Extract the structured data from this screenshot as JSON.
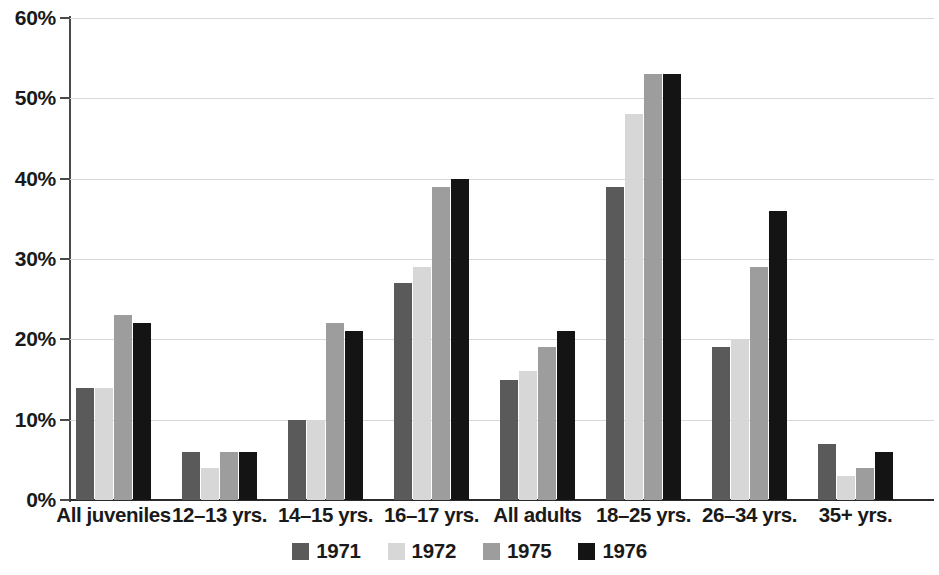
{
  "chart_data": {
    "type": "bar",
    "title": "",
    "subtitle": "",
    "xlabel": "",
    "ylabel": "",
    "ylim": [
      0,
      60
    ],
    "y_tick_values": [
      0,
      10,
      20,
      30,
      40,
      50,
      60
    ],
    "y_tick_labels": [
      "0%",
      "10%",
      "20%",
      "30%",
      "40%",
      "50%",
      "60%"
    ],
    "grid": true,
    "grid_axis": "y",
    "legend_position": "bottom",
    "categories": [
      "All juveniles",
      "12–13 yrs.",
      "14–15 yrs.",
      "16–17 yrs.",
      "All adults",
      "18–25 yrs.",
      "26–34 yrs.",
      "35+ yrs."
    ],
    "series": [
      {
        "name": "1971",
        "color": "#5a5a5a",
        "values": [
          14,
          6,
          10,
          27,
          15,
          39,
          19,
          7
        ]
      },
      {
        "name": "1972",
        "color": "#d7d7d7",
        "values": [
          14,
          4,
          10,
          29,
          16,
          48,
          20,
          3
        ]
      },
      {
        "name": "1975",
        "color": "#9d9d9d",
        "values": [
          23,
          6,
          22,
          39,
          19,
          53,
          29,
          4
        ]
      },
      {
        "name": "1976",
        "color": "#141414",
        "values": [
          22,
          6,
          21,
          40,
          21,
          53,
          36,
          6
        ]
      }
    ]
  },
  "legend": {
    "items": [
      {
        "label": "1971",
        "color": "#5a5a5a"
      },
      {
        "label": "1972",
        "color": "#d7d7d7"
      },
      {
        "label": "1975",
        "color": "#9d9d9d"
      },
      {
        "label": "1976",
        "color": "#141414"
      }
    ]
  },
  "axis": {
    "gridline_color": "#d8d8dc",
    "baseline_color": "#2b2b2b",
    "axis_color": "#4a4a4a"
  }
}
